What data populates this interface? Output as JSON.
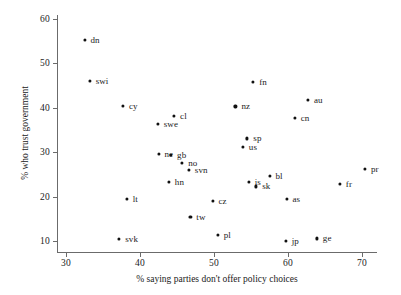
{
  "chart_data": {
    "type": "scatter",
    "title": "",
    "xlabel": "% saying parties don't offer policy choices",
    "ylabel": "% who trust government",
    "xlim": [
      27,
      72
    ],
    "ylim": [
      7,
      62
    ],
    "xticks": [
      30,
      40,
      50,
      60,
      70
    ],
    "yticks": [
      10,
      20,
      30,
      40,
      50,
      60
    ],
    "grid": false,
    "legend": "none",
    "points": [
      {
        "label": "dn",
        "x": 32.5,
        "y": 55.3,
        "lx": 6,
        "ly": 0
      },
      {
        "label": "swi",
        "x": 33.2,
        "y": 46.0,
        "lx": 6,
        "ly": 0
      },
      {
        "label": "cy",
        "x": 37.7,
        "y": 40.5,
        "lx": 6,
        "ly": 0
      },
      {
        "label": "cl",
        "x": 44.6,
        "y": 38.1,
        "lx": 6,
        "ly": 0
      },
      {
        "label": "swe",
        "x": 42.4,
        "y": 36.3,
        "lx": 6,
        "ly": 0
      },
      {
        "label": "ne",
        "x": 42.5,
        "y": 29.7,
        "lx": 6,
        "ly": 0
      },
      {
        "label": "gb",
        "x": 44.2,
        "y": 29.4,
        "lx": 6,
        "ly": 0
      },
      {
        "label": "no",
        "x": 45.7,
        "y": 27.6,
        "lx": 6,
        "ly": 0
      },
      {
        "label": "svn",
        "x": 46.6,
        "y": 26.1,
        "lx": 6,
        "ly": 0
      },
      {
        "label": "hn",
        "x": 43.9,
        "y": 23.3,
        "lx": 6,
        "ly": 0
      },
      {
        "label": "lt",
        "x": 38.2,
        "y": 19.4,
        "lx": 6,
        "ly": 0
      },
      {
        "label": "tw",
        "x": 46.8,
        "y": 15.4,
        "lx": 6,
        "ly": 0
      },
      {
        "label": "svk",
        "x": 37.2,
        "y": 10.5,
        "lx": 6,
        "ly": 0
      },
      {
        "label": "pl",
        "x": 50.5,
        "y": 11.4,
        "lx": 6,
        "ly": 0
      },
      {
        "label": "fn",
        "x": 55.3,
        "y": 45.9,
        "lx": 6,
        "ly": 0
      },
      {
        "label": "nz",
        "x": 52.9,
        "y": 40.3,
        "lx": 6,
        "ly": 0
      },
      {
        "label": "au",
        "x": 62.7,
        "y": 41.8,
        "lx": 6,
        "ly": 0
      },
      {
        "label": "cn",
        "x": 60.9,
        "y": 37.7,
        "lx": 6,
        "ly": 0
      },
      {
        "label": "sp",
        "x": 54.5,
        "y": 33.1,
        "lx": 6,
        "ly": 0
      },
      {
        "label": "us",
        "x": 53.9,
        "y": 31.2,
        "lx": 6,
        "ly": 0
      },
      {
        "label": "is",
        "x": 54.7,
        "y": 23.4,
        "lx": 6,
        "ly": 0
      },
      {
        "label": "sk",
        "x": 55.7,
        "y": 22.3,
        "lx": 6,
        "ly": 0
      },
      {
        "label": "bl",
        "x": 57.5,
        "y": 24.6,
        "lx": 6,
        "ly": 0
      },
      {
        "label": "cz",
        "x": 49.8,
        "y": 19.0,
        "lx": 6,
        "ly": 0
      },
      {
        "label": "as",
        "x": 59.8,
        "y": 19.5,
        "lx": 6,
        "ly": 0
      },
      {
        "label": "pr",
        "x": 70.4,
        "y": 26.2,
        "lx": 6,
        "ly": 0
      },
      {
        "label": "fr",
        "x": 67.0,
        "y": 22.8,
        "lx": 6,
        "ly": 0
      },
      {
        "label": "jp",
        "x": 59.7,
        "y": 10.0,
        "lx": 6,
        "ly": 0
      },
      {
        "label": "ge",
        "x": 63.9,
        "y": 10.6,
        "lx": 6,
        "ly": 0
      }
    ]
  },
  "axes": {
    "x_title": "% saying parties don't offer policy choices",
    "y_title": "% who trust government",
    "x_tick_labels": [
      "30",
      "40",
      "50",
      "60",
      "70"
    ],
    "y_tick_labels": [
      "10",
      "20",
      "30",
      "40",
      "50",
      "60"
    ]
  },
  "colors": {
    "point": "#111111",
    "axis": "#6b6b6b",
    "text": "#1a1a1a",
    "background": "#ffffff"
  }
}
